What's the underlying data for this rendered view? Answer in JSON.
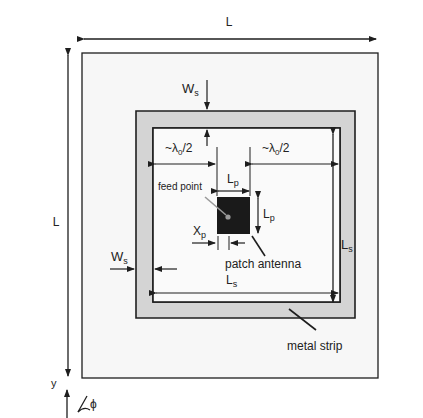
{
  "diagram": {
    "type": "antenna-layout",
    "labels": {
      "L_top": "L",
      "L_left": "L",
      "Ws_top_main": "W",
      "Ws_top_sub": "s",
      "Ws_left_main": "W",
      "Ws_left_sub": "s",
      "lambda_left": "~λ",
      "lambda_left_sub": "0",
      "lambda_left_tail": "/2",
      "lambda_right": "~λ",
      "lambda_right_sub": "0",
      "lambda_right_tail": "/2",
      "Lp_top_main": "L",
      "Lp_top_sub": "p",
      "Lp_right_main": "L",
      "Lp_right_sub": "p",
      "Xp_main": "X",
      "Xp_sub": "p",
      "Ls_right_main": "L",
      "Ls_right_sub": "s",
      "Ls_bottom_main": "L",
      "Ls_bottom_sub": "s",
      "feed_point": "feed point",
      "patch_antenna": "patch antenna",
      "metal_strip": "metal strip",
      "axis_y": "y",
      "axis_phi": "ϕ"
    },
    "colors": {
      "board_fill": "#f7f7f7",
      "strip_fill": "#d4d4d4",
      "patch_fill": "#1a1a1a",
      "feed_dot": "#9a9a9a",
      "line": "#1e1e1e"
    }
  }
}
